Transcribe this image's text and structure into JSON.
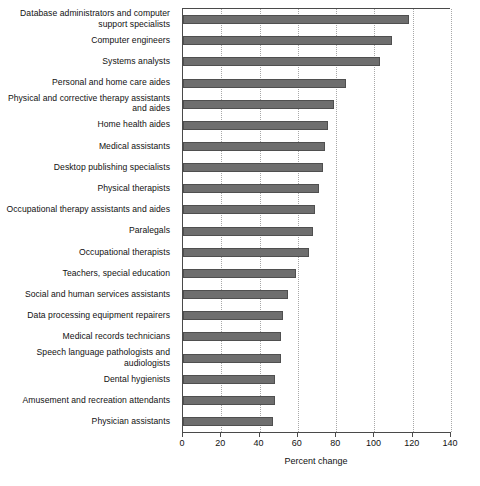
{
  "chart_data": {
    "type": "bar",
    "orientation": "horizontal",
    "title": "",
    "subtitle": "",
    "xlabel": "Percent change",
    "ylabel": "",
    "xlim": [
      0,
      140
    ],
    "xticks": [
      0,
      20,
      40,
      60,
      80,
      100,
      120,
      140
    ],
    "xtick_labels": [
      "0",
      "20",
      "40",
      "60",
      "80",
      "100",
      "120",
      "140"
    ],
    "grid": "vertical-dotted",
    "legend": "none",
    "bar_color": "#6e6e6e",
    "bar_edge_color": "#4f4f4f",
    "axis_color": "#4a4a4a",
    "gridline_color": "#a8a8a8",
    "categories": [
      "Database administrators and computer support specialists",
      "Computer engineers",
      "Systems analysts",
      "Personal and home care aides",
      "Physical and corrective therapy assistants and aides",
      "Home health aides",
      "Medical assistants",
      "Desktop publishing specialists",
      "Physical therapists",
      "Occupational therapy assistants and aides",
      "Paralegals",
      "Occupational therapists",
      "Teachers, special education",
      "Social and human services assistants",
      "Data processing equipment repairers",
      "Medical records technicians",
      "Speech language pathologists and audiologists",
      "Dental hygienists",
      "Amusement and recreation attendants",
      "Physician assistants"
    ],
    "values": [
      118,
      109,
      103,
      85,
      79,
      76,
      74,
      73,
      71,
      69,
      68,
      66,
      59,
      55,
      52,
      51,
      51,
      48,
      48,
      47
    ]
  }
}
